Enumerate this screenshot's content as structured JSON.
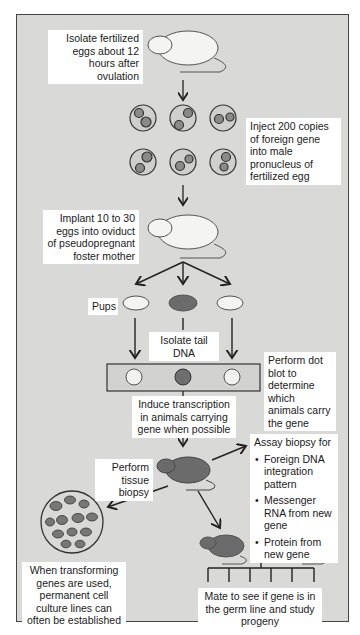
{
  "steps": {
    "isolate": "Isolate fertilized eggs about 12 hours after ovulation",
    "inject": "Inject 200 copies of foreign gene into male pronucleus of fertilized egg",
    "implant": "Implant 10 to 30 eggs into oviduct of pseudopregnant foster mother",
    "pups": "Pups",
    "tail_dna": "Isolate tail DNA",
    "dot_blot": "Perform dot blot to determine which animals carry the gene",
    "induce": "Induce transcription in animals carrying gene when possible",
    "biopsy": "Perform tissue biopsy",
    "assay_title": "Assay biopsy for",
    "assay_items": [
      "Foreign DNA integration pattern",
      "Messenger RNA from new gene",
      "Protein from new gene"
    ],
    "cell_culture": "When transforming genes are used, permanent cell culture lines can often be established",
    "mate": "Mate to see if gene is in the germ line and study progeny"
  },
  "colors": {
    "background": "#d9d9d7",
    "label_bg": "#ffffff",
    "dark_mouse": "#6b6b6b",
    "dot_positive": "#6e6e6e"
  }
}
